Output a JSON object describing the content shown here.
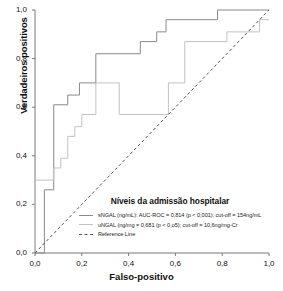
{
  "chart_data": {
    "type": "line",
    "title": "",
    "xlabel": "Falso-positivo",
    "ylabel": "Verdadeiros positivos",
    "xlim": [
      0,
      1
    ],
    "ylim": [
      0,
      1
    ],
    "grid": false,
    "legend_position": "inside-lower-right",
    "legend_title": "Níveis da admissão hospitalar",
    "xticks": [
      "0,0",
      "0,2",
      "0,4",
      "0,6",
      "0,8",
      "1,0"
    ],
    "xtick_values": [
      0,
      0.2,
      0.4,
      0.6,
      0.8,
      1.0
    ],
    "yticks": [
      "0,0",
      "0,2",
      "0,4",
      "0,6",
      "0,8",
      "1,0"
    ],
    "ytick_values": [
      0,
      0.2,
      0.4,
      0.6,
      0.8,
      1.0
    ],
    "series": [
      {
        "name": "sNGAL (ng/mL): AUC-ROC = 0,814 (p < 0,001); cut-off = 154ng/mL",
        "short_name": "sNGAL",
        "color": "#8a8a8a",
        "style": "step",
        "dash": false,
        "auc": 0.814,
        "p_value": "< 0,001",
        "cut_off": "154ng/mL",
        "points": [
          [
            0.0,
            0.0
          ],
          [
            0.04,
            0.0
          ],
          [
            0.04,
            0.26
          ],
          [
            0.08,
            0.26
          ],
          [
            0.08,
            0.61
          ],
          [
            0.14,
            0.61
          ],
          [
            0.14,
            0.65
          ],
          [
            0.19,
            0.65
          ],
          [
            0.19,
            0.7
          ],
          [
            0.26,
            0.7
          ],
          [
            0.26,
            0.82
          ],
          [
            0.45,
            0.82
          ],
          [
            0.45,
            0.87
          ],
          [
            0.52,
            0.87
          ],
          [
            0.52,
            0.91
          ],
          [
            0.56,
            0.91
          ],
          [
            0.56,
            0.96
          ],
          [
            0.78,
            0.96
          ],
          [
            0.78,
            1.0
          ],
          [
            1.0,
            1.0
          ]
        ]
      },
      {
        "name": "uNGAL (ng/mg = 0,681 (p < 0,o5); cut-off = 10,6ng/mg-Cr",
        "short_name": "uNGAL",
        "color": "#c2c2c2",
        "style": "step",
        "dash": false,
        "auc": 0.681,
        "p_value": "< 0,05",
        "cut_off": "10,6ng/mg-Cr",
        "points": [
          [
            0.0,
            0.0
          ],
          [
            0.0,
            0.3
          ],
          [
            0.08,
            0.3
          ],
          [
            0.08,
            0.35
          ],
          [
            0.11,
            0.35
          ],
          [
            0.11,
            0.39
          ],
          [
            0.14,
            0.39
          ],
          [
            0.14,
            0.48
          ],
          [
            0.17,
            0.48
          ],
          [
            0.17,
            0.52
          ],
          [
            0.2,
            0.52
          ],
          [
            0.2,
            0.57
          ],
          [
            0.26,
            0.57
          ],
          [
            0.26,
            0.7
          ],
          [
            0.36,
            0.7
          ],
          [
            0.36,
            0.57
          ],
          [
            0.57,
            0.57
          ],
          [
            0.57,
            0.7
          ],
          [
            0.64,
            0.7
          ],
          [
            0.64,
            0.87
          ],
          [
            0.82,
            0.87
          ],
          [
            0.82,
            0.91
          ],
          [
            0.96,
            0.91
          ],
          [
            0.96,
            0.96
          ],
          [
            1.0,
            0.96
          ]
        ]
      },
      {
        "name": "Reference Line",
        "short_name": "Reference Line",
        "color": "#555555",
        "style": "line",
        "dash": true,
        "points": [
          [
            0.0,
            0.0
          ],
          [
            1.0,
            1.0
          ]
        ]
      }
    ]
  },
  "axes": {
    "ylabel": "Verdadeiros positivos",
    "xlabel": "Falso-positivo"
  },
  "legend": {
    "title": "Níveis da admissão hospitalar",
    "items": [
      {
        "label": "sNGAL (ng/mL): AUC-ROC = 0,814 (p < 0,001); cut-off = 154ng/mL"
      },
      {
        "label": "uNGAL (ng/mg = 0,681 (p < 0,o5); cut-off = 10,6ng/mg-Cr"
      },
      {
        "label": "Reference Line"
      }
    ]
  }
}
